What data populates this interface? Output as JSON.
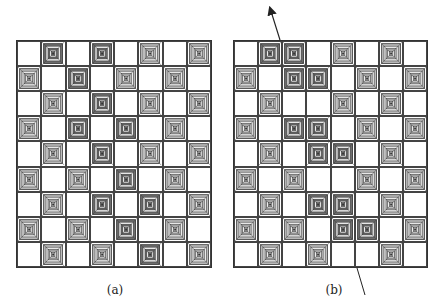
{
  "figure": {
    "panels": [
      {
        "id": "a",
        "caption": "(a)",
        "cols": 8,
        "rows": 9,
        "grid": [
          "_D_D_L_L",
          "L_D_L_L_",
          "_L_D_L_L",
          "L_D_D_L_",
          "_L_D_L_L",
          "L_L_D_L_",
          "_L_D_D_L",
          "L_L_D_L_",
          "_L_L_D_L"
        ]
      },
      {
        "id": "b",
        "caption": "(b)",
        "cols": 8,
        "rows": 9,
        "grid": [
          "_DD_L_L_",
          "L_DD_L_L",
          "_L__L_L_",
          "L_DD_L_L",
          "_L_DD_L_",
          "L_L__L_L",
          "_L_DD_L_",
          "L_L_DD_L",
          "_L_L__L_"
        ],
        "annotations": [
          {
            "type": "arrow",
            "from": [
              280,
              40
            ],
            "to": [
              270,
              8
            ]
          },
          {
            "type": "line",
            "from": [
              357,
              268
            ],
            "to": [
              365,
              295
            ]
          }
        ]
      }
    ],
    "legend": {
      "D": "dark concentric-square tile",
      "L": "light concentric-square tile",
      "_": "empty cell"
    },
    "colors": {
      "dark_fill": "#6e6e6e",
      "light_fill": "#bdbdbd",
      "line": "#333333"
    }
  }
}
